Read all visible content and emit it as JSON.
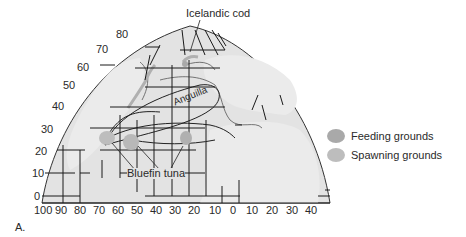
{
  "figure": {
    "panel_label": "A.",
    "species_labels": {
      "cod": "Icelandic cod",
      "eel": "Anguilla",
      "tuna": "Bluefin tuna"
    },
    "latitude_labels": [
      "80",
      "70",
      "60",
      "50",
      "40",
      "30",
      "20",
      "10",
      "0"
    ],
    "longitude_labels": [
      "100",
      "90",
      "80",
      "70",
      "60",
      "50",
      "40",
      "30",
      "20",
      "10",
      "0",
      "10",
      "20",
      "30",
      "40"
    ]
  },
  "legend": {
    "items": [
      {
        "label": "Feeding grounds",
        "color": "#a9a9a9"
      },
      {
        "label": "Spawning grounds",
        "color": "#bdbdbd"
      }
    ]
  },
  "colors": {
    "ocean": "#e4e4e4",
    "land": "#ececec",
    "grid": "#1a1a1a",
    "feeding": "#a9a9a9",
    "spawning": "#bdbdbd"
  }
}
